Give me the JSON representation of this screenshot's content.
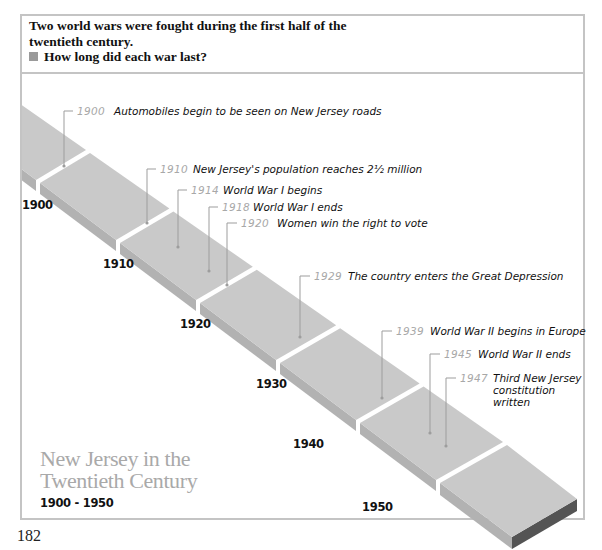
{
  "question": {
    "intro": "Two world wars were fought during the first half of the twentieth century.",
    "intro_line1": "Two world wars were fought during the first half of the",
    "intro_line2": "twentieth century.",
    "prompt": "How long did each war last?",
    "bullet_icon": "square-bullet-icon"
  },
  "timeline": {
    "title_line1": "New Jersey in the",
    "title_line2": "Twentieth Century",
    "range": "1900 - 1950",
    "decades": [
      "1900",
      "1910",
      "1920",
      "1930",
      "1940",
      "1950"
    ],
    "events": [
      {
        "year": "1900",
        "text": "Automobiles begin to be seen on New Jersey roads"
      },
      {
        "year": "1910",
        "text": "New Jersey's population reaches 2½ million"
      },
      {
        "year": "1914",
        "text": "World War I begins"
      },
      {
        "year": "1918",
        "text": "World War I ends"
      },
      {
        "year": "1920",
        "text": "Women win the right to vote"
      },
      {
        "year": "1929",
        "text": "The country enters the Great Depression"
      },
      {
        "year": "1939",
        "text": "World War II begins in Europe"
      },
      {
        "year": "1945",
        "text": "World War II ends"
      },
      {
        "year": "1947",
        "text": "Third New Jersey constitution written",
        "lines": [
          "Third New Jersey",
          "constitution",
          "written"
        ]
      }
    ],
    "colors": {
      "block_top": "#c9c9c9",
      "block_front": "#b2b2b2",
      "block_end": "#545454",
      "leader": "#9d9d9d",
      "year_label": "#a8a8a8"
    }
  },
  "page_number": "182"
}
